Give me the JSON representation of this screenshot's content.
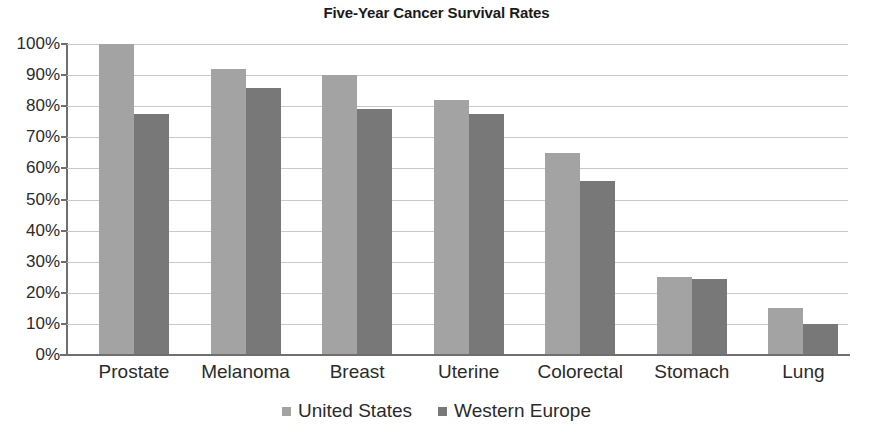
{
  "chart_data": {
    "type": "bar",
    "title": "Five-Year Cancer Survival Rates",
    "xlabel": "",
    "ylabel": "",
    "categories": [
      "Prostate",
      "Melanoma",
      "Breast",
      "Uterine",
      "Colorectal",
      "Stomach",
      "Lung"
    ],
    "series": [
      {
        "name": "United States",
        "color": "#a3a3a3",
        "values": [
          100,
          92,
          90,
          82,
          65,
          25,
          15
        ]
      },
      {
        "name": "Western Europe",
        "color": "#787878",
        "values": [
          77.5,
          86,
          79,
          77.5,
          56,
          24.5,
          10
        ]
      }
    ],
    "ylim": [
      0,
      100
    ],
    "y_ticks": [
      "0%",
      "10%",
      "20%",
      "30%",
      "40%",
      "50%",
      "60%",
      "70%",
      "80%",
      "90%",
      "100%"
    ],
    "y_tick_values": [
      0,
      10,
      20,
      30,
      40,
      50,
      60,
      70,
      80,
      90,
      100
    ],
    "grid": true,
    "grid_axis": "y",
    "legend_position": "bottom",
    "value_suffix": "%"
  }
}
